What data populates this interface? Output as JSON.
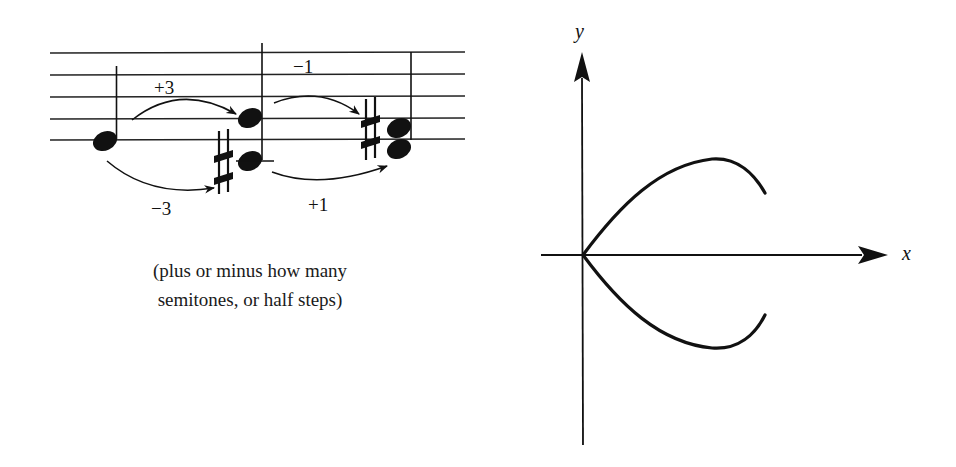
{
  "music_example": {
    "staff": {
      "lines_y": [
        53,
        75,
        97,
        119,
        140
      ],
      "x_start": 50,
      "x_end": 465
    },
    "intervals": [
      {
        "label": "+3",
        "direction": "up",
        "from": "note-1",
        "to": "chord-2-upper"
      },
      {
        "label": "−3",
        "direction": "down",
        "from": "note-1",
        "to": "chord-2-lower"
      },
      {
        "label": "−1",
        "direction": "up",
        "from": "chord-2-upper",
        "to": "chord-3"
      },
      {
        "label": "+1",
        "direction": "down",
        "from": "chord-2-lower",
        "to": "chord-3"
      }
    ],
    "accidental_symbol": "sharp",
    "caption_line1": "(plus or minus how many",
    "caption_line2": "semitones, or half steps)"
  },
  "graph": {
    "x_axis_label": "x",
    "y_axis_label": "y",
    "origin": [
      582,
      255
    ],
    "curve_description": "Two symmetric arcs emanating from origin: upper arc rises to a maximum then curves back down; lower arc is its mirror image about the x-axis"
  },
  "colors": {
    "ink": "#111111",
    "background": "#ffffff"
  }
}
